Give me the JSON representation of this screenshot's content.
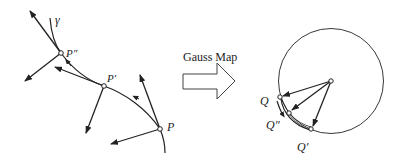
{
  "figure": {
    "type": "gauss-map-diagram",
    "curve": {
      "label": "γ",
      "points": [
        {
          "id": "P2",
          "label": "P″"
        },
        {
          "id": "P1",
          "label": "P′"
        },
        {
          "id": "P0",
          "label": "P"
        }
      ]
    },
    "map": {
      "label": "Gauss Map"
    },
    "sphere": {
      "points": [
        {
          "id": "Q0",
          "label": "Q"
        },
        {
          "id": "Q2",
          "label": "Q″"
        },
        {
          "id": "Q1",
          "label": "Q′"
        }
      ]
    },
    "colors": {
      "stroke": "#222222",
      "background": "#ffffff"
    }
  }
}
